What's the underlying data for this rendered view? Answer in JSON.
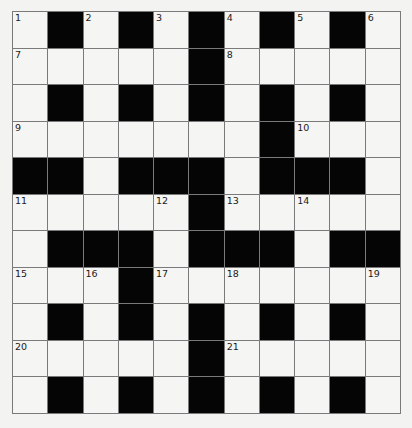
{
  "puzzle": {
    "rows": 11,
    "cols": 11,
    "colors": {
      "white_cell": "#f5f5f3",
      "black_cell": "#050505",
      "grid_line": "#7a7a7a",
      "number_text": "#1a1a1a"
    },
    "grid": [
      [
        "1",
        "#",
        "2",
        "#",
        "3",
        "#",
        "4",
        "#",
        "5",
        "#",
        "6"
      ],
      [
        "7",
        ".",
        ".",
        ".",
        ".",
        "#",
        "8",
        ".",
        ".",
        ".",
        "."
      ],
      [
        ".",
        "#",
        ".",
        "#",
        ".",
        "#",
        ".",
        "#",
        ".",
        "#",
        "."
      ],
      [
        "9",
        ".",
        ".",
        ".",
        ".",
        ".",
        ".",
        "#",
        "10",
        ".",
        "."
      ],
      [
        "#",
        "#",
        ".",
        "#",
        "#",
        "#",
        ".",
        "#",
        "#",
        "#",
        "."
      ],
      [
        "11",
        ".",
        ".",
        ".",
        "12",
        "#",
        "13",
        ".",
        "14",
        ".",
        "."
      ],
      [
        ".",
        "#",
        "#",
        "#",
        ".",
        "#",
        "#",
        "#",
        ".",
        "#",
        "#"
      ],
      [
        "15",
        ".",
        "16",
        "#",
        "17",
        ".",
        "18",
        ".",
        ".",
        ".",
        "19"
      ],
      [
        ".",
        "#",
        ".",
        "#",
        ".",
        "#",
        ".",
        "#",
        ".",
        "#",
        "."
      ],
      [
        "20",
        ".",
        ".",
        ".",
        ".",
        "#",
        "21",
        ".",
        ".",
        ".",
        "."
      ],
      [
        ".",
        "#",
        ".",
        "#",
        ".",
        "#",
        ".",
        "#",
        ".",
        "#",
        "."
      ]
    ],
    "legend": {
      "#": "black square",
      ".": "empty white square",
      "number": "white square with clue number"
    },
    "clue_numbers": [
      "1",
      "2",
      "3",
      "4",
      "5",
      "6",
      "7",
      "8",
      "9",
      "10",
      "11",
      "12",
      "13",
      "14",
      "15",
      "16",
      "17",
      "18",
      "19",
      "20",
      "21"
    ]
  }
}
